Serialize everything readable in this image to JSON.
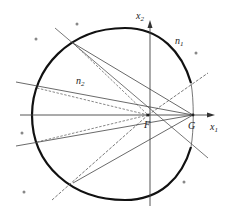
{
  "diagram": {
    "type": "geometric-figure",
    "labels": {
      "x1_axis": {
        "base": "x",
        "sub": "1"
      },
      "x2_axis": {
        "base": "x",
        "sub": "2"
      },
      "region_n1": {
        "base": "n",
        "sub": "1"
      },
      "region_n2": {
        "base": "n",
        "sub": "2"
      },
      "point_F": "F",
      "point_G": "G"
    },
    "colors": {
      "curve": "#111111",
      "lines": "#555555",
      "axes": "#444444",
      "markers": "#888888"
    },
    "points": {
      "F": [
        148,
        115
      ],
      "G": [
        193,
        115
      ]
    },
    "boundary_intersections": [
      [
        73,
        43
      ],
      [
        37,
        88
      ],
      [
        37,
        142
      ],
      [
        73,
        183
      ]
    ],
    "markers": [
      [
        77,
        24
      ],
      [
        36,
        39
      ],
      [
        196,
        53
      ],
      [
        22,
        133
      ],
      [
        24,
        192
      ],
      [
        184,
        182
      ]
    ]
  }
}
